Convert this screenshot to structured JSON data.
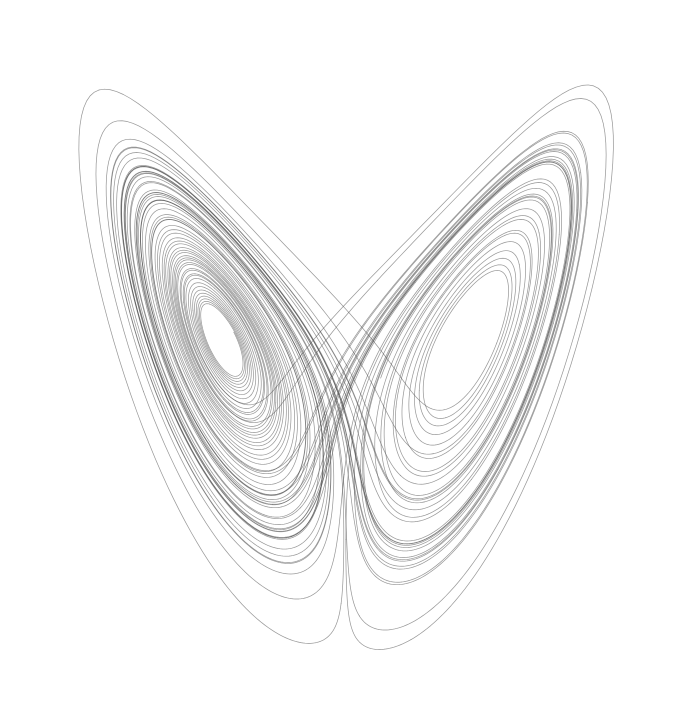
{
  "figure": {
    "name": "lorenz-attractor",
    "caption": "",
    "width": 690,
    "height": 723,
    "background_color": "#ffffff",
    "line_color": "#555555",
    "line_width": 0.7,
    "line_opacity": 0.62,
    "projection": "xz"
  },
  "chart_data": {
    "type": "line",
    "subtitle": "",
    "xlabel": "",
    "ylabel": "",
    "grid": false,
    "legend": false,
    "axes_visible": false,
    "series": [
      {
        "name": "lorenz-trajectory",
        "color": "#555555",
        "generator": "lorenz-system",
        "system": {
          "equations": [
            "dx/dt = sigma * (y - x)",
            "dy/dt = x * (rho - z) - y",
            "dz/dt = x * y - beta * z"
          ],
          "sigma": 10.0,
          "rho": 28.0,
          "beta": 2.6666666667
        },
        "initial_state": {
          "x": 0.9,
          "y": 2.4,
          "z": 1.2
        },
        "integration": {
          "method": "rk4",
          "dt": 0.0042,
          "steps": 15800,
          "discard_transient_steps": 260
        }
      }
    ],
    "xlim": [
      -21.5,
      21.5
    ],
    "zlim": [
      0.0,
      49.5
    ],
    "plot_box": {
      "x0": 33,
      "y0": 33,
      "x1": 657,
      "y1": 708
    },
    "landmarks": {
      "left_wing_tip": {
        "px": 48,
        "py": 48
      },
      "right_wing_tip": {
        "px": 628,
        "py": 37
      },
      "center_valley": {
        "px": 345,
        "py": 312
      },
      "left_lobe_center": {
        "px": 200,
        "py": 370
      },
      "right_lobe_center": {
        "px": 480,
        "py": 368
      },
      "left_lobe_bottom": {
        "px": 300,
        "py": 706
      },
      "right_lobe_bottom": {
        "px": 420,
        "py": 692
      },
      "leftmost": {
        "px": 33,
        "py": 158
      },
      "rightmost": {
        "px": 656,
        "py": 205
      }
    },
    "fixed_points": {
      "origin": {
        "x": 0,
        "y": 0,
        "z": 0
      },
      "c_plus": {
        "x": 8.485,
        "y": 8.485,
        "z": 27
      },
      "c_minus": {
        "x": -8.485,
        "y": -8.485,
        "z": 27
      }
    }
  }
}
